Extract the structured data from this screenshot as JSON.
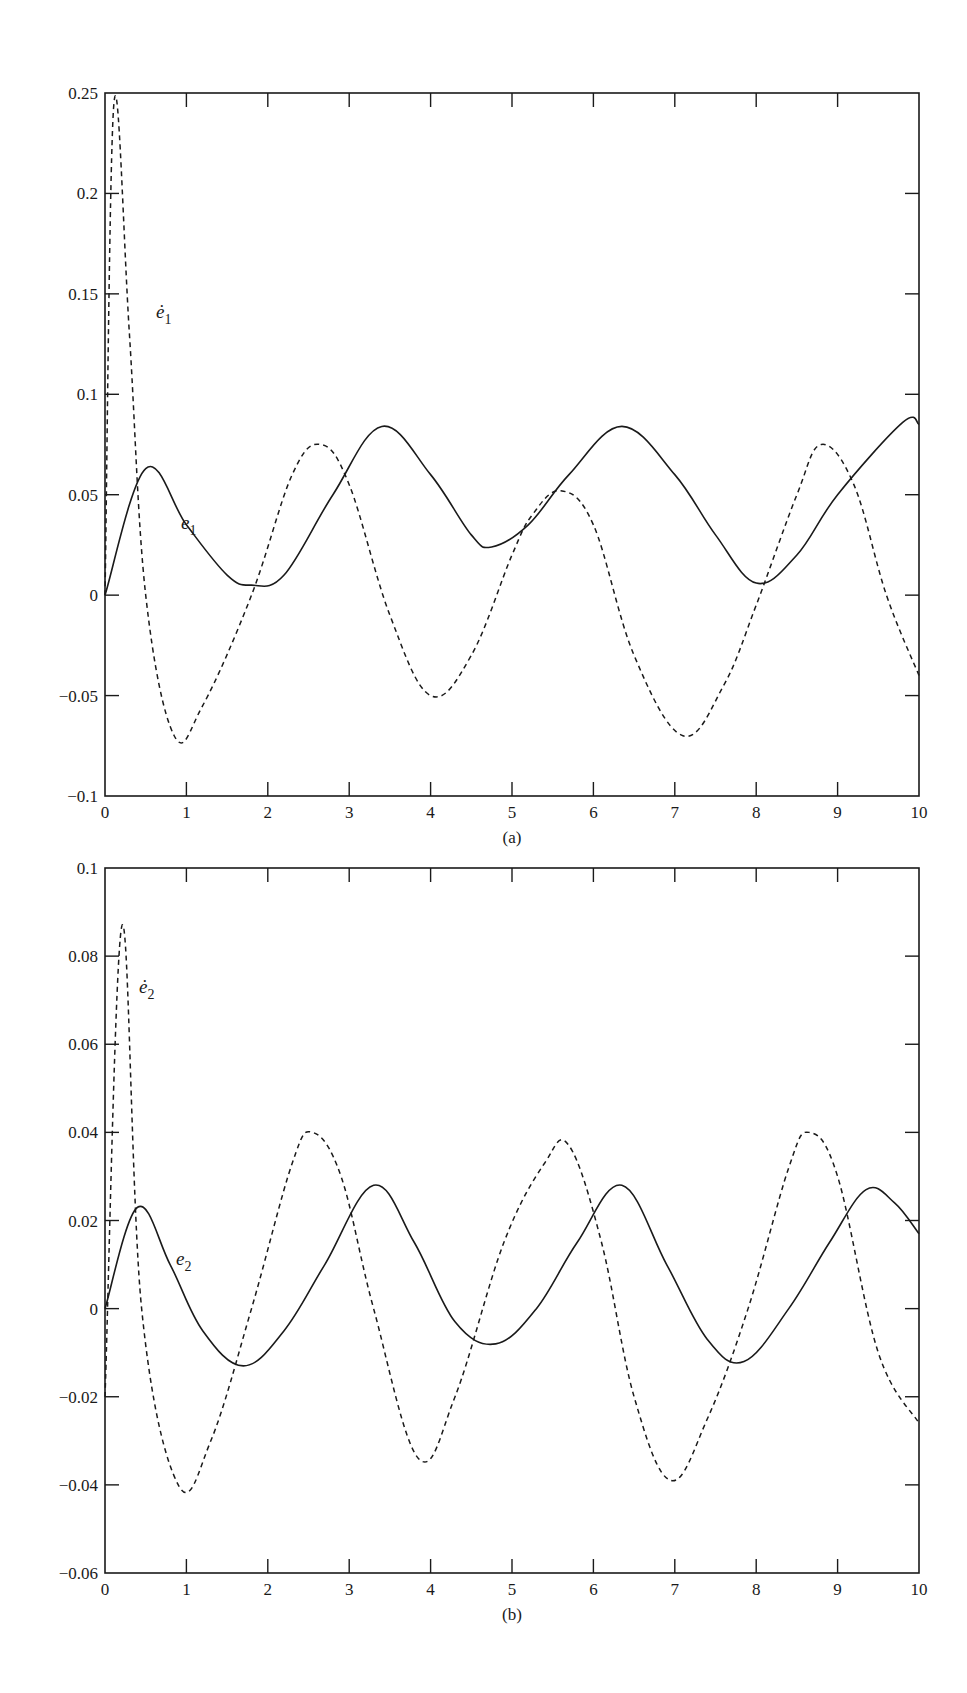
{
  "chart_data": [
    {
      "type": "line",
      "panel": "(a)",
      "title": "",
      "xlabel": "",
      "ylabel": "",
      "xlim": [
        0,
        10
      ],
      "ylim": [
        -0.1,
        0.25
      ],
      "xticks": [
        "0",
        "1",
        "2",
        "3",
        "4",
        "5",
        "6",
        "7",
        "8",
        "9",
        "10"
      ],
      "yticks": [
        "-0.1",
        "-0.05",
        "0",
        "0.05",
        "0.1",
        "0.15",
        "0.2",
        "0.25"
      ],
      "ytick_values": [
        -0.1,
        -0.05,
        0,
        0.05,
        0.1,
        0.15,
        0.2,
        0.25
      ],
      "grid": false,
      "series": [
        {
          "name": "e1",
          "label_base": "e",
          "label_sub": "1",
          "style": "solid",
          "x": [
            0,
            0.5,
            1.0,
            1.5,
            1.8,
            2.2,
            2.8,
            3.4,
            4.0,
            4.5,
            4.75,
            5.2,
            5.7,
            6.35,
            7.0,
            7.5,
            8.0,
            8.5,
            9.0,
            9.8,
            10
          ],
          "y": [
            0,
            0.063,
            0.035,
            0.01,
            0.005,
            0.01,
            0.05,
            0.084,
            0.06,
            0.03,
            0.024,
            0.035,
            0.06,
            0.084,
            0.06,
            0.03,
            0.006,
            0.02,
            0.05,
            0.086,
            0.085
          ]
        },
        {
          "name": "e1_dot",
          "label_base": "ė",
          "label_sub": "1",
          "style": "dashed",
          "x": [
            0,
            0.11,
            0.3,
            0.5,
            0.85,
            1.2,
            1.8,
            2.3,
            2.65,
            3.0,
            3.5,
            4.0,
            4.5,
            5.0,
            5.25,
            5.6,
            6.0,
            6.5,
            7.1,
            7.6,
            8.0,
            8.5,
            8.8,
            9.2,
            9.6,
            10
          ],
          "y": [
            0,
            0.245,
            0.13,
            0.0,
            -0.07,
            -0.055,
            0.0,
            0.06,
            0.075,
            0.055,
            -0.01,
            -0.05,
            -0.03,
            0.02,
            0.04,
            0.052,
            0.035,
            -0.03,
            -0.07,
            -0.045,
            -0.005,
            0.05,
            0.075,
            0.055,
            0.0,
            -0.04
          ]
        }
      ]
    },
    {
      "type": "line",
      "panel": "(b)",
      "title": "",
      "xlabel": "",
      "ylabel": "",
      "xlim": [
        0,
        10
      ],
      "ylim": [
        -0.06,
        0.1
      ],
      "xticks": [
        "0",
        "1",
        "2",
        "3",
        "4",
        "5",
        "6",
        "7",
        "8",
        "9",
        "10"
      ],
      "yticks": [
        "-0.06",
        "-0.04",
        "-0.02",
        "0",
        "0.02",
        "0.04",
        "0.06",
        "0.08",
        "0.1"
      ],
      "ytick_values": [
        -0.06,
        -0.04,
        -0.02,
        0,
        0.02,
        0.04,
        0.06,
        0.08,
        0.1
      ],
      "grid": false,
      "series": [
        {
          "name": "e2",
          "label_base": "e",
          "label_sub": "2",
          "style": "solid",
          "x": [
            0,
            0.4,
            0.8,
            1.2,
            1.7,
            2.2,
            2.7,
            3.3,
            3.8,
            4.3,
            4.8,
            5.3,
            5.8,
            6.35,
            6.9,
            7.4,
            7.85,
            8.4,
            8.9,
            9.35,
            9.7,
            10
          ],
          "y": [
            0,
            0.023,
            0.01,
            -0.005,
            -0.013,
            -0.005,
            0.01,
            0.028,
            0.015,
            -0.003,
            -0.008,
            0.0,
            0.015,
            0.028,
            0.01,
            -0.007,
            -0.012,
            0.0,
            0.015,
            0.027,
            0.024,
            0.017
          ]
        },
        {
          "name": "e2_dot",
          "label_base": "ė",
          "label_sub": "2",
          "style": "dashed",
          "x": [
            0,
            0.21,
            0.45,
            0.9,
            1.3,
            1.8,
            2.3,
            2.55,
            2.9,
            3.3,
            3.85,
            4.3,
            4.9,
            5.4,
            5.7,
            6.1,
            6.5,
            6.95,
            7.4,
            7.9,
            8.4,
            8.65,
            9.0,
            9.5,
            10
          ],
          "y": [
            -0.02,
            0.087,
            0.0,
            -0.04,
            -0.03,
            0.0,
            0.033,
            0.04,
            0.03,
            0.0,
            -0.034,
            -0.02,
            0.015,
            0.033,
            0.037,
            0.015,
            -0.02,
            -0.039,
            -0.025,
            0.0,
            0.032,
            0.04,
            0.03,
            -0.01,
            -0.026
          ]
        }
      ]
    }
  ],
  "panels": {
    "a": {
      "caption": "(a)",
      "label_e": "e",
      "label_e_sub": "1",
      "label_edot": "ė",
      "label_edot_sub": "1"
    },
    "b": {
      "caption": "(b)",
      "label_e": "e",
      "label_e_sub": "2",
      "label_edot": "ė",
      "label_edot_sub": "2"
    }
  },
  "colors": {
    "line": "#1a1a1a",
    "background": "#ffffff"
  }
}
